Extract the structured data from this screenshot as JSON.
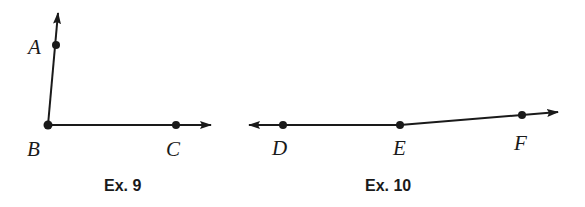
{
  "figures": [
    {
      "caption": "Ex. 9",
      "description": "Angle ABC formed by ray BA and ray BC",
      "points": {
        "A": {
          "label": "A",
          "x": 56,
          "y": 45
        },
        "B": {
          "label": "B",
          "x": 48,
          "y": 125
        },
        "C": {
          "label": "C",
          "x": 176,
          "y": 125
        }
      },
      "rays": [
        {
          "from": "B",
          "through": "A",
          "tip": [
            58,
            13
          ]
        },
        {
          "from": "B",
          "through": "C",
          "tip": [
            211,
            125
          ]
        }
      ]
    },
    {
      "caption": "Ex. 10",
      "description": "Ray ED and ray EF sharing endpoint E",
      "points": {
        "D": {
          "label": "D",
          "x": 283,
          "y": 125
        },
        "E": {
          "label": "E",
          "x": 400,
          "y": 125
        },
        "F": {
          "label": "F",
          "x": 522,
          "y": 115
        }
      },
      "rays": [
        {
          "from": "E",
          "through": "D",
          "tip": [
            249,
            125
          ]
        },
        {
          "from": "E",
          "through": "F",
          "tip": [
            558,
            112
          ]
        }
      ]
    }
  ],
  "colors": {
    "ink": "#1a1a1a",
    "background": "#ffffff"
  }
}
